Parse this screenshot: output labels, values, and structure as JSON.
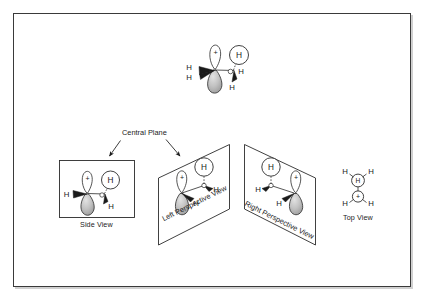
{
  "figure": {
    "background_color": "#ffffff",
    "frame_color": "#3a3a3a",
    "ink_color": "#1a1a1a",
    "lobe_shade_color": "#b4b4b4"
  },
  "annotations": {
    "central_plane_label": "Central Plane"
  },
  "panels": [
    {
      "id": "top-molecule",
      "label": "",
      "shape": "none",
      "atom_labels": [
        "H",
        "H",
        "H",
        "H",
        "H"
      ],
      "orbital_sign": "+"
    },
    {
      "id": "side-view",
      "label": "Side View",
      "shape": "rectangle",
      "atom_labels": [
        "H",
        "H",
        "H"
      ],
      "orbital_sign": "+"
    },
    {
      "id": "left-perspective-view",
      "label": "Left Perspective View",
      "shape": "parallelogram",
      "atom_labels": [
        "H",
        "H",
        "H"
      ],
      "orbital_sign": "+"
    },
    {
      "id": "right-perspective-view",
      "label": "Right Perspective View",
      "shape": "parallelogram",
      "atom_labels": [
        "H",
        "H",
        "H"
      ],
      "orbital_sign": "+"
    },
    {
      "id": "top-view",
      "label": "Top View",
      "shape": "none",
      "atom_labels": [
        "H",
        "H",
        "H",
        "H"
      ],
      "center_circle_label": "H",
      "orbital_sign": "+"
    }
  ],
  "glyphs": {
    "hydrogen": "H",
    "plus": "+"
  }
}
